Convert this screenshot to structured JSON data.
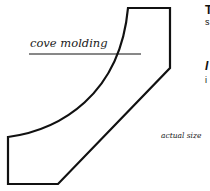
{
  "diagram": {
    "callout_label": "cove molding",
    "caption": "actual size",
    "stroke_color": "#111111",
    "background": "#ffffff"
  },
  "cropped_text": {
    "line1": "T",
    "line2": "s",
    "line3": "I",
    "line4": "i"
  }
}
